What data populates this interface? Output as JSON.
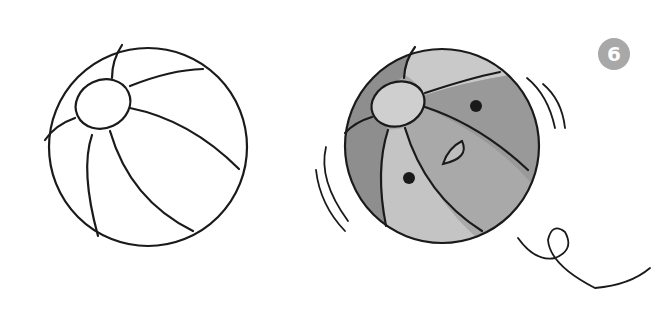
{
  "step_badge": {
    "label": "6",
    "color": "#a8a8a8"
  },
  "colors": {
    "ink": "#1a1a1a",
    "dark_panel": "#8e8e8e",
    "mid_panel": "#a9a9a9",
    "light_panel": "#c9c9c9",
    "background": "#ffffff"
  },
  "figures": [
    {
      "name": "outline-beach-ball",
      "description": "uncolored line drawing"
    },
    {
      "name": "colored-beach-ball",
      "description": "shaded ball with face and motion lines"
    }
  ]
}
